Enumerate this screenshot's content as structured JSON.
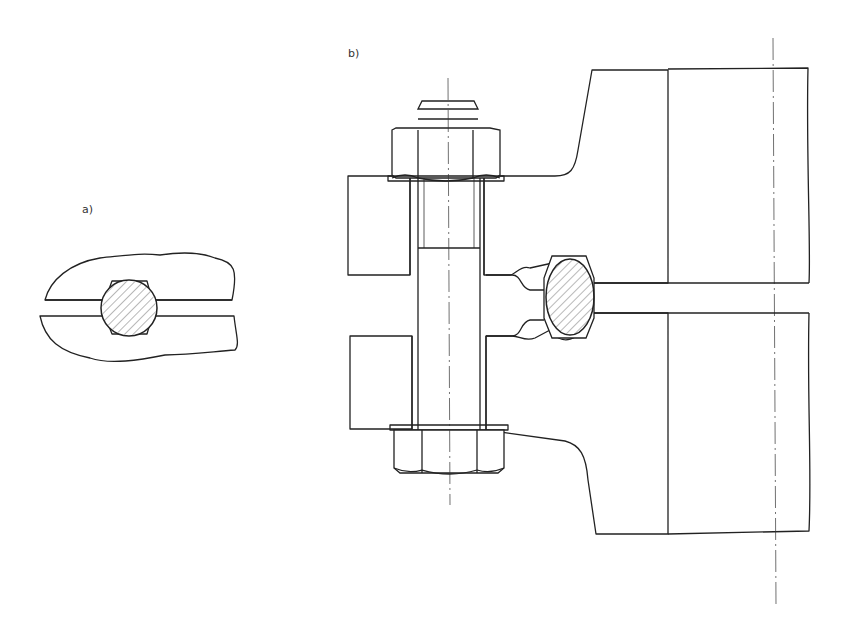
{
  "figure": {
    "labels": {
      "a": "a)",
      "b": "b)"
    },
    "views": [
      {
        "id": "a",
        "description": "Detail: oval ring gasket seated in octagonal grooves between two flange faces (sectioned, hatched)"
      },
      {
        "id": "b",
        "description": "Flanged joint section: stud bolt with two hex nuts clamping two flanges, ring-type joint gasket in grooves, pipe centerline at right"
      }
    ],
    "colors": {
      "line": "#222222",
      "background": "#ffffff"
    }
  }
}
